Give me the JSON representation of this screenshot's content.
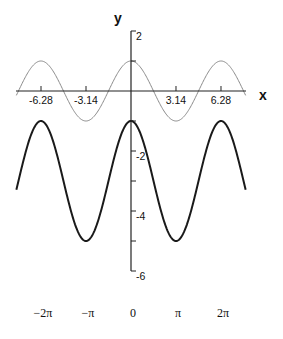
{
  "chart_data": {
    "type": "line",
    "title": "",
    "xlabel": "x",
    "ylabel": "y",
    "xlim": [
      -8,
      8
    ],
    "ylim": [
      -6,
      2
    ],
    "grid": false,
    "legend": null,
    "x_ticks": [
      {
        "value": -6.28,
        "label": "-6.28"
      },
      {
        "value": -3.14,
        "label": "-3.14"
      },
      {
        "value": 3.14,
        "label": "3.14"
      },
      {
        "value": 6.28,
        "label": "6.28"
      }
    ],
    "y_ticks": [
      {
        "value": 2,
        "label": "2"
      },
      {
        "value": 1,
        "label": ""
      },
      {
        "value": -1,
        "label": ""
      },
      {
        "value": -2,
        "label": "-2"
      },
      {
        "value": -3,
        "label": ""
      },
      {
        "value": -4,
        "label": "-4"
      },
      {
        "value": -5,
        "label": ""
      },
      {
        "value": -6,
        "label": "-6"
      }
    ],
    "pi_labels": [
      {
        "value": -6.2832,
        "label": "−2π"
      },
      {
        "value": -3.1416,
        "label": "−π"
      },
      {
        "value": 0,
        "label": "0"
      },
      {
        "value": 3.1416,
        "label": "π"
      },
      {
        "value": 6.2832,
        "label": "2π"
      }
    ],
    "series": [
      {
        "name": "y = cos x",
        "color": "#8a8a8a",
        "width": 1,
        "amplitude": 1,
        "offset": 0,
        "key_points": [
          {
            "x": -6.28,
            "y": 1
          },
          {
            "x": -3.14,
            "y": -1
          },
          {
            "x": 0,
            "y": 1
          },
          {
            "x": 3.14,
            "y": -1
          },
          {
            "x": 6.28,
            "y": 1
          }
        ]
      },
      {
        "name": "y = 2cos x - 3",
        "color": "#1a1a1a",
        "width": 2,
        "amplitude": 2,
        "offset": -3,
        "key_points": [
          {
            "x": -6.28,
            "y": -1
          },
          {
            "x": -3.14,
            "y": -5
          },
          {
            "x": 0,
            "y": -1
          },
          {
            "x": 3.14,
            "y": -5
          },
          {
            "x": 6.28,
            "y": -1
          }
        ]
      }
    ]
  }
}
